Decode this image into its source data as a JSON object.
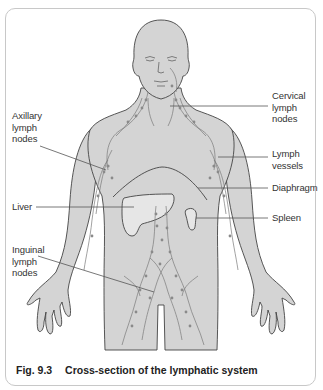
{
  "figure": {
    "number": "Fig. 9.3",
    "title": "Cross-section of the lymphatic system"
  },
  "labels": {
    "cervical": [
      "Cervical",
      "lymph",
      "nodes"
    ],
    "axillary": [
      "Axillary",
      "lymph",
      "nodes"
    ],
    "lymph_vessels": [
      "Lymph",
      "vessels"
    ],
    "diaphragm": "Diaphragm",
    "liver": "Liver",
    "spleen": "Spleen",
    "inguinal": [
      "Inguinal",
      "lymph",
      "nodes"
    ]
  },
  "colors": {
    "body_fill": "#d4d4d4",
    "organ_fill": "#e6e6e6",
    "outline": "#444444",
    "vessel": "#7a7a7a",
    "leader_line": "#555555",
    "frame_border": "#c8c8c8"
  }
}
